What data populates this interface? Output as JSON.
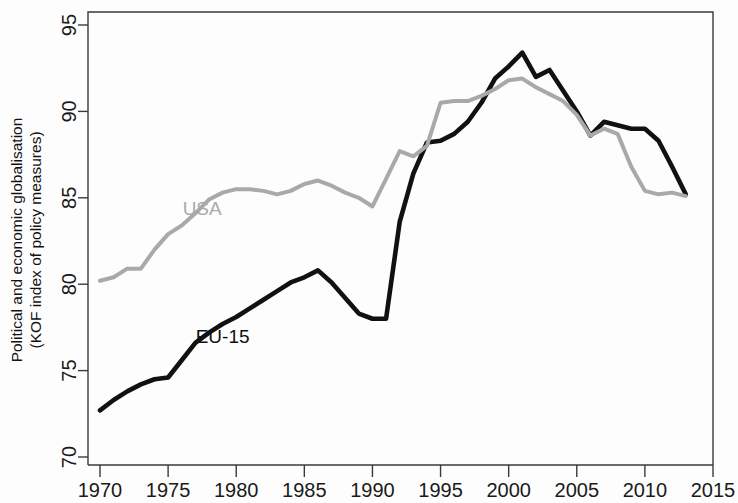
{
  "chart_data": {
    "type": "line",
    "title": "",
    "subtitle": "",
    "xlabel": "",
    "ylabel": "Political and economic globalisation (KOF index of policy measures)",
    "ylabel_line1": "Political and economic globalisation",
    "ylabel_line2": "(KOF index of policy measures)",
    "xlim": [
      1970,
      2015
    ],
    "ylim": [
      70,
      95
    ],
    "xticks": [
      1970,
      1975,
      1980,
      1985,
      1990,
      1995,
      2000,
      2005,
      2010,
      2015
    ],
    "xtick_labels": [
      "1970",
      "1975",
      "1980",
      "1985",
      "1990",
      "1995",
      "2000",
      "2005",
      "2010",
      "2015"
    ],
    "yticks": [
      70,
      75,
      80,
      85,
      90,
      95
    ],
    "ytick_labels": [
      "70",
      "75",
      "80",
      "85",
      "90",
      "95"
    ],
    "grid": false,
    "legend_position": "inline-annotation",
    "x": [
      1970,
      1971,
      1972,
      1973,
      1974,
      1975,
      1976,
      1977,
      1978,
      1979,
      1980,
      1981,
      1982,
      1983,
      1984,
      1985,
      1986,
      1987,
      1988,
      1989,
      1990,
      1991,
      1992,
      1993,
      1994,
      1995,
      1996,
      1997,
      1998,
      1999,
      2000,
      2001,
      2002,
      2003,
      2004,
      2005,
      2006,
      2007,
      2008,
      2009,
      2010,
      2011,
      2012,
      2013
    ],
    "series": [
      {
        "name": "EU-15",
        "color": "#111111",
        "label_x": 1979,
        "label_y": 76.6,
        "values": [
          72.7,
          73.3,
          73.8,
          74.2,
          74.5,
          74.6,
          75.6,
          76.6,
          77.2,
          77.7,
          78.1,
          78.6,
          79.1,
          79.6,
          80.1,
          80.4,
          80.8,
          80.1,
          79.2,
          78.3,
          78.0,
          78.0,
          83.6,
          86.4,
          88.2,
          88.3,
          88.7,
          89.4,
          90.5,
          91.9,
          92.6,
          93.4,
          92.0,
          92.4,
          91.2,
          90.0,
          88.6,
          89.4,
          89.2,
          89.0,
          89.0,
          88.3,
          86.8,
          85.2
        ]
      },
      {
        "name": "USA",
        "color": "#a9a9a9",
        "label_x": 1977.5,
        "label_y": 84.0,
        "values": [
          80.2,
          80.4,
          80.9,
          80.9,
          82.0,
          82.9,
          83.4,
          84.1,
          84.9,
          85.3,
          85.5,
          85.5,
          85.4,
          85.2,
          85.4,
          85.8,
          86.0,
          85.7,
          85.3,
          85.0,
          84.5,
          86.1,
          87.7,
          87.4,
          88.0,
          90.5,
          90.6,
          90.6,
          90.9,
          91.3,
          91.8,
          91.9,
          91.4,
          91.0,
          90.6,
          89.8,
          88.6,
          89.0,
          88.7,
          86.8,
          85.4,
          85.2,
          85.3,
          85.1
        ]
      }
    ]
  },
  "axes": {
    "ylabel_line1": "Political and economic globalisation",
    "ylabel_line2": "(KOF index of policy measures)"
  },
  "annotations": {
    "usa_label": "USA",
    "eu15_label": "EU-15"
  },
  "colors": {
    "eu15": "#111111",
    "usa": "#a9a9a9",
    "axis": "#3a3a3a",
    "background": "#fdfdfd"
  }
}
